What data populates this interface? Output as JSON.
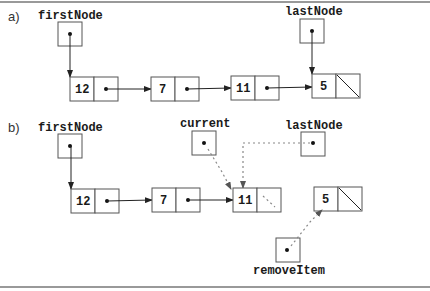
{
  "figure": {
    "part_a": {
      "label": "a)",
      "pointers": [
        {
          "name": "firstNode"
        },
        {
          "name": "lastNode"
        }
      ],
      "nodes": [
        {
          "value": "12",
          "next": "pointer"
        },
        {
          "value": "7",
          "next": "pointer"
        },
        {
          "value": "11",
          "next": "pointer"
        },
        {
          "value": "5",
          "next": "null"
        }
      ]
    },
    "part_b": {
      "label": "b)",
      "pointers": [
        {
          "name": "firstNode"
        },
        {
          "name": "current"
        },
        {
          "name": "lastNode"
        },
        {
          "name": "removeItem"
        }
      ],
      "nodes": [
        {
          "value": "12",
          "next": "pointer"
        },
        {
          "value": "7",
          "next": "pointer"
        },
        {
          "value": "11",
          "next": "pointer (dashed, removed)"
        },
        {
          "value": "5",
          "next": "null"
        }
      ]
    },
    "colors": {
      "solid_arrow": "#222222",
      "dashed_arrow": "#888888",
      "box_border": "#555555"
    }
  }
}
